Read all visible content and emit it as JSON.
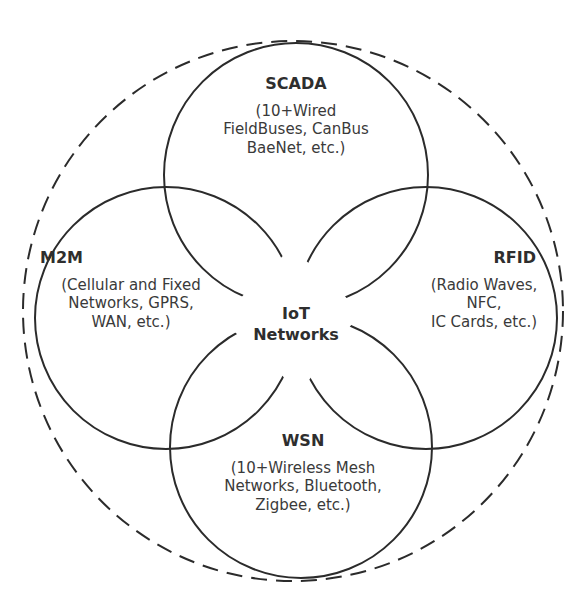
{
  "diagram": {
    "center": {
      "line1": "IoT",
      "line2": "Networks"
    },
    "nodes": [
      {
        "title": "SCADA",
        "lines": [
          "(10+Wired",
          "FieldBuses, CanBus",
          "BaeNet, etc.)"
        ]
      },
      {
        "title": "M2M",
        "lines": [
          "(Cellular and Fixed",
          "Networks, GPRS,",
          "WAN, etc.)"
        ]
      },
      {
        "title": "RFID",
        "lines": [
          "(Radio Waves,",
          "NFC,",
          "IC Cards, etc.)"
        ]
      },
      {
        "title": "WSN",
        "lines": [
          "(10+Wireless Mesh",
          "Networks, Bluetooth,",
          "Zigbee, etc.)"
        ]
      }
    ],
    "colors": {
      "stroke": "#2b2b2b",
      "background": "#ffffff"
    }
  }
}
